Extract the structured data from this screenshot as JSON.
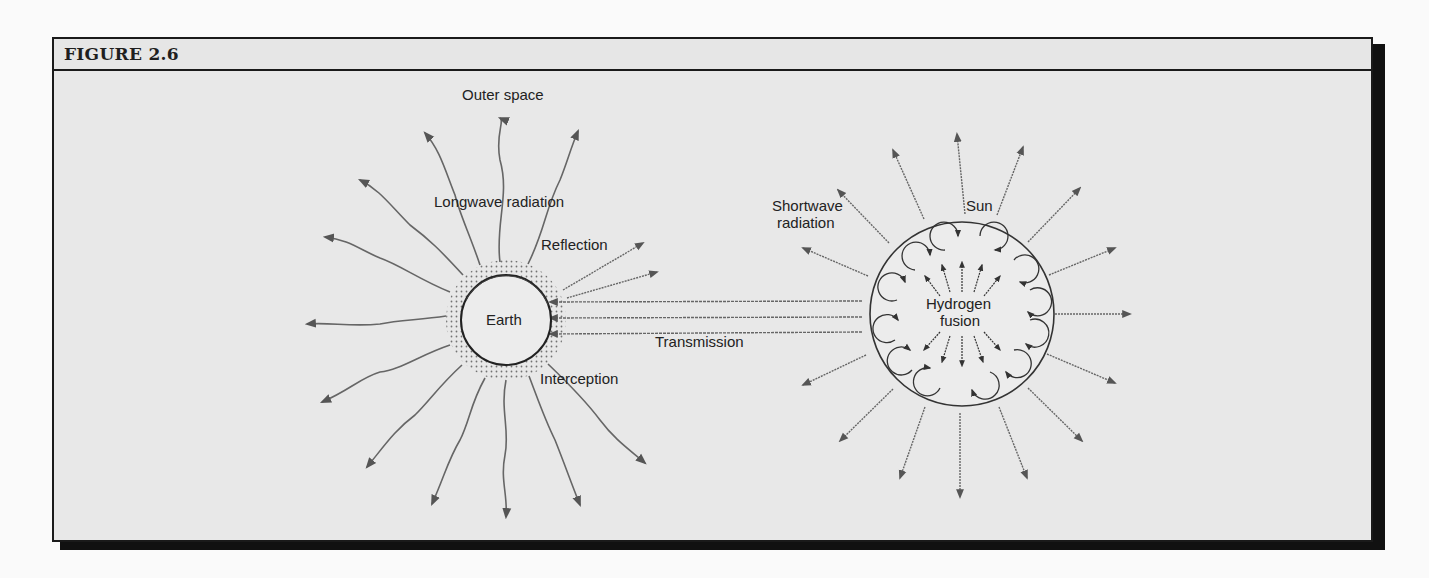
{
  "figure": {
    "title": "FIGURE 2.6"
  },
  "labels": {
    "outer_space": "Outer space",
    "longwave_radiation": "Longwave radiation",
    "reflection": "Reflection",
    "earth": "Earth",
    "transmission": "Transmission",
    "interception": "Interception",
    "shortwave_radiation_line1": "Shortwave",
    "shortwave_radiation_line2": "radiation",
    "sun": "Sun",
    "hydrogen_fusion_line1": "Hydrogen",
    "fusion_line2": "fusion"
  },
  "colors": {
    "background": "#e8e8e8",
    "frame": "#1a1a1a",
    "line": "#555555",
    "text": "#222222"
  }
}
